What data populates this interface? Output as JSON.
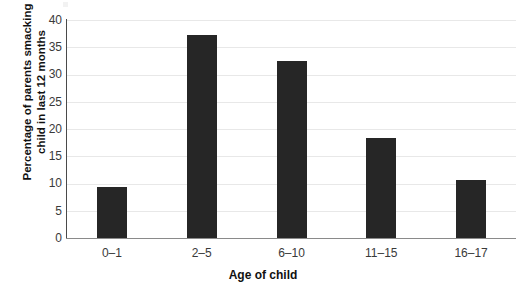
{
  "chart_data": {
    "type": "bar",
    "title": "",
    "subtitle": "",
    "xlabel": "Age of child",
    "ylabel": "Percentage of parents smacking child in last 12 months",
    "ylabel_line1": "Percentage of parents smacking",
    "ylabel_line2": "child in last 12 months",
    "categories": [
      "0–1",
      "2–5",
      "6–10",
      "11–15",
      "16–17"
    ],
    "values": [
      9.3,
      37.2,
      32.4,
      18.4,
      10.6
    ],
    "series": [
      {
        "name": "Percentage of parents smacking child in last 12 months",
        "values": [
          9.3,
          37.2,
          32.4,
          18.4,
          10.6
        ]
      }
    ],
    "ylim": [
      0,
      40
    ],
    "xlim": null,
    "yticks": [
      0,
      5,
      10,
      15,
      20,
      25,
      30,
      35,
      40
    ],
    "ytick_labels": [
      "0",
      "5",
      "10",
      "15",
      "20",
      "25",
      "30",
      "35",
      "40"
    ],
    "grid": true,
    "grid_axis": "y",
    "legend": false,
    "legend_position": "none",
    "annotations": [],
    "colors": {
      "bar": "#262626",
      "gridline": "#e8e8e8",
      "axis": "#4a4a4a",
      "x_axis": "#8a8a8a",
      "text": "#3a3a3a",
      "title_text": "#111111",
      "background": "#ffffff"
    }
  }
}
